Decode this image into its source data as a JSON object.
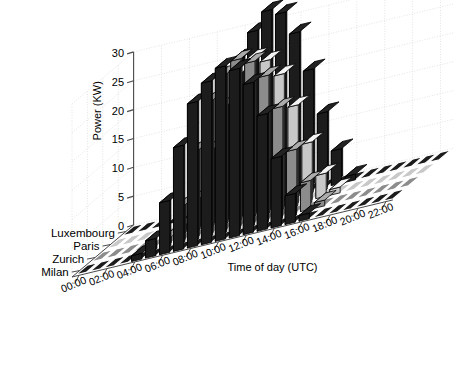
{
  "chart_data": {
    "type": "bar",
    "render": "3d-bar",
    "title": "",
    "xlabel": "Time of day (UTC)",
    "ylabel": "",
    "zlabel": "Power (KW)",
    "categories": [
      "00:00",
      "01:00",
      "02:00",
      "03:00",
      "04:00",
      "05:00",
      "06:00",
      "07:00",
      "08:00",
      "09:00",
      "10:00",
      "11:00",
      "12:00",
      "13:00",
      "14:00",
      "15:00",
      "16:00",
      "17:00",
      "18:00",
      "19:00",
      "20:00",
      "21:00",
      "22:00"
    ],
    "xtick_labels": [
      "00:00",
      "02:00",
      "04:00",
      "06:00",
      "08:00",
      "10:00",
      "12:00",
      "14:00",
      "16:00",
      "18:00",
      "20:00",
      "22:00"
    ],
    "ytick_labels": [
      "0",
      "5",
      "10",
      "15",
      "20",
      "25",
      "30"
    ],
    "zlim": [
      0,
      30
    ],
    "grid": true,
    "legend_position": "none",
    "series": [
      {
        "name": "Luxembourg",
        "color": "#1c1c1c",
        "values": [
          0,
          0,
          0,
          0,
          0,
          1,
          7,
          17,
          26,
          30,
          33,
          32,
          28,
          21,
          13,
          6,
          1,
          0,
          0,
          0,
          0,
          0,
          0
        ]
      },
      {
        "name": "Paris",
        "color": "#c8c8c8",
        "values": [
          0,
          0,
          0,
          0,
          0,
          1,
          5,
          13,
          20,
          25,
          27,
          26,
          23,
          17,
          10,
          4,
          1,
          0,
          0,
          0,
          0,
          0,
          0
        ]
      },
      {
        "name": "Zurich",
        "color": "#8c8c8c",
        "values": [
          0,
          0,
          0,
          0,
          0,
          1,
          6,
          15,
          23,
          27,
          29,
          28,
          25,
          19,
          11,
          5,
          1,
          0,
          0,
          0,
          0,
          0,
          0
        ]
      },
      {
        "name": "Milan",
        "color": "#1c1c1c",
        "values": [
          0,
          0,
          0,
          0,
          1,
          3,
          9,
          18,
          25,
          28,
          30,
          29,
          26,
          20,
          12,
          5,
          1,
          0,
          0,
          0,
          0,
          0,
          0
        ]
      }
    ],
    "row_order_back_to_front": [
      "Luxembourg",
      "Paris",
      "Zurich",
      "Milan"
    ],
    "row_labels": [
      "Milan",
      "Zurich",
      "Paris",
      "Luxembourg"
    ],
    "colors": {
      "background": "#ffffff",
      "grid": "#d9d9d9",
      "axis": "#555555",
      "dark_bar": "#1c1c1c",
      "mid_bar": "#8c8c8c",
      "light_bar": "#c8c8c8",
      "edge": "#000000"
    }
  }
}
